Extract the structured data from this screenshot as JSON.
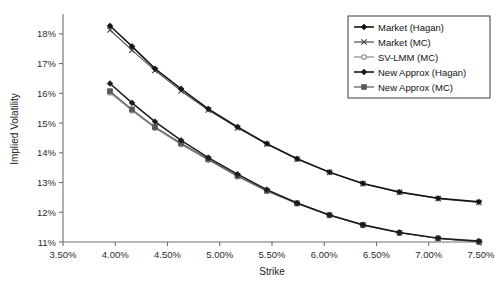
{
  "chart_data": {
    "type": "line",
    "title": "",
    "xlabel": "Strike",
    "ylabel": "Implied Volatility",
    "xlim": [
      3.5,
      7.5
    ],
    "ylim": [
      11,
      18.6
    ],
    "grid": false,
    "legend_position": "top-right",
    "x_tick_labels": [
      "3.50%",
      "4.00%",
      "4.50%",
      "5.00%",
      "5.50%",
      "6.00%",
      "6.50%",
      "7.00%",
      "7.50%"
    ],
    "x_tick_values": [
      3.5,
      4.0,
      4.5,
      5.0,
      5.5,
      6.0,
      6.5,
      7.0,
      7.5
    ],
    "y_tick_labels": [
      "11%",
      "12%",
      "13%",
      "14%",
      "15%",
      "16%",
      "17%",
      "18%"
    ],
    "y_tick_values": [
      11,
      12,
      13,
      14,
      15,
      16,
      17,
      18
    ],
    "x": [
      3.95,
      4.16,
      4.38,
      4.63,
      4.89,
      5.17,
      5.45,
      5.74,
      6.05,
      6.37,
      6.72,
      7.09,
      7.48
    ],
    "series": [
      {
        "name": "Market (Hagan)",
        "marker": "diamond",
        "color": "#141414",
        "values": [
          18.27,
          17.58,
          16.83,
          16.15,
          15.48,
          14.87,
          14.31,
          13.8,
          13.35,
          12.97,
          12.68,
          12.47,
          12.35
        ]
      },
      {
        "name": "Market (MC)",
        "marker": "cross",
        "color": "#4a4a4a",
        "values": [
          18.13,
          17.45,
          16.77,
          16.08,
          15.44,
          14.84,
          14.29,
          13.79,
          13.34,
          12.96,
          12.67,
          12.46,
          12.33
        ]
      },
      {
        "name": "SV-LMM (MC)",
        "marker": "circle-open",
        "color": "#8a8a8a",
        "values": [
          16.02,
          15.42,
          14.83,
          14.28,
          13.76,
          13.2,
          12.71,
          12.29,
          11.9,
          11.56,
          11.31,
          11.12,
          10.99
        ]
      },
      {
        "name": "New Approx (Hagan)",
        "marker": "diamond",
        "color": "#1c1c1c",
        "values": [
          16.33,
          15.68,
          15.05,
          14.42,
          13.84,
          13.28,
          12.76,
          12.31,
          11.91,
          11.58,
          11.32,
          11.13,
          11.03
        ]
      },
      {
        "name": "New Approx (MC)",
        "marker": "square",
        "color": "#565656",
        "values": [
          16.07,
          15.46,
          14.87,
          14.32,
          13.79,
          13.23,
          12.73,
          12.3,
          11.9,
          11.57,
          11.31,
          11.12,
          11.01
        ]
      }
    ]
  }
}
